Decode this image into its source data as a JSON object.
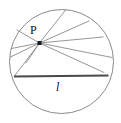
{
  "figure": {
    "type": "geometry-diagram",
    "width": 121,
    "height": 123,
    "background_color": "#ffffff",
    "stroke_color": "#8a8a8a",
    "bold_stroke_color": "#4a4a4a",
    "label_color": "#111111"
  },
  "labels": {
    "point_p": "P",
    "chord_l": "l"
  },
  "chart_data": {
    "type": "scatter",
    "title": "",
    "xlabel": "",
    "ylabel": "",
    "circle": {
      "center_x": 61.5,
      "center_y": 61.5,
      "radius": 52.0
    },
    "point": {
      "name": "P",
      "x": 39.5,
      "y": 43.0,
      "marker": "filled-square",
      "marker_size": 4
    },
    "bold_chord": {
      "name": "l",
      "x1": 14.0,
      "y1": 76.5,
      "x2": 108.5,
      "y2": 75.5
    },
    "thin_chords": [
      {
        "x1": 39.5,
        "y1": 43.0,
        "x2": 66.0,
        "y2": 9.5
      },
      {
        "x1": 39.5,
        "y1": 43.0,
        "x2": 89.0,
        "y2": 21.0
      },
      {
        "x1": 39.5,
        "y1": 43.0,
        "x2": 103.0,
        "y2": 37.0
      },
      {
        "x1": 39.5,
        "y1": 43.0,
        "x2": 112.0,
        "y2": 57.5
      },
      {
        "x1": 39.5,
        "y1": 43.0,
        "x2": 104.0,
        "y2": 72.5
      },
      {
        "x1": 39.5,
        "y1": 43.0,
        "x2": 14.5,
        "y2": 76.0
      },
      {
        "x1": 39.5,
        "y1": 43.0,
        "x2": 10.5,
        "y2": 57.0
      },
      {
        "x1": 39.5,
        "y1": 43.0,
        "x2": 11.5,
        "y2": 48.5
      },
      {
        "x1": 39.5,
        "y1": 43.0,
        "x2": 17.0,
        "y2": 30.0
      },
      {
        "x1": 39.5,
        "y1": 43.0,
        "x2": 26.0,
        "y2": 63.0
      }
    ]
  }
}
